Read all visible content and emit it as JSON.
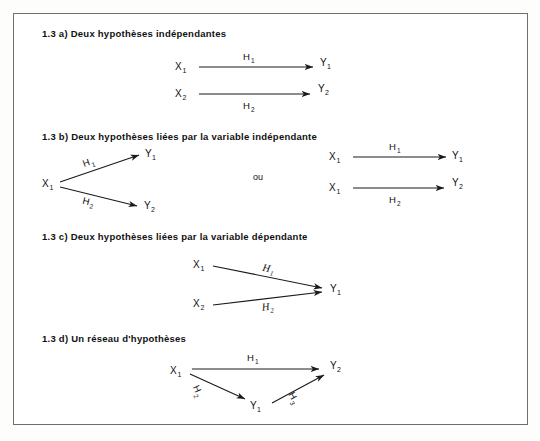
{
  "figure": {
    "frame_color": "#6f6f6f",
    "ink_color": "#111111",
    "separator_label": "ou"
  },
  "sections": [
    {
      "id": "a",
      "heading": "1.3 a)  Deux hypothèses indépendantes",
      "diagram_type": "two-independent-arrows",
      "nodes": [
        {
          "label": "X",
          "sub": "1",
          "role": "independent"
        },
        {
          "label": "Y",
          "sub": "1",
          "role": "dependent"
        },
        {
          "label": "X",
          "sub": "2",
          "role": "independent"
        },
        {
          "label": "Y",
          "sub": "2",
          "role": "dependent"
        }
      ],
      "edges": [
        {
          "label": "H",
          "sub": "1",
          "from": "X1",
          "to": "Y1",
          "label_position": "above"
        },
        {
          "label": "H",
          "sub": "2",
          "from": "X2",
          "to": "Y2",
          "label_position": "below"
        }
      ]
    },
    {
      "id": "b",
      "heading": "1.3 b)  Deux hypothèses liées par la variable indépendante",
      "diagram_type": "diverging-then-equivalent-pair",
      "nodes": [
        {
          "label": "X",
          "sub": "1",
          "role": "independent"
        },
        {
          "label": "Y",
          "sub": "1",
          "role": "dependent"
        },
        {
          "label": "Y",
          "sub": "2",
          "role": "dependent"
        }
      ],
      "edges": [
        {
          "label": "H",
          "sub": "1",
          "from": "X1",
          "to": "Y1",
          "label_position": "along"
        },
        {
          "label": "H",
          "sub": "2",
          "from": "X1",
          "to": "Y2",
          "label_position": "along"
        }
      ],
      "alternative_nodes": [
        {
          "label": "X",
          "sub": "1",
          "role": "independent"
        },
        {
          "label": "Y",
          "sub": "1",
          "role": "dependent"
        },
        {
          "label": "X",
          "sub": "1",
          "role": "independent"
        },
        {
          "label": "Y",
          "sub": "2",
          "role": "dependent"
        }
      ],
      "alternative_edges": [
        {
          "label": "H",
          "sub": "1",
          "from": "X1",
          "to": "Y1",
          "label_position": "above"
        },
        {
          "label": "H",
          "sub": "2",
          "from": "X1",
          "to": "Y2",
          "label_position": "below"
        }
      ]
    },
    {
      "id": "c",
      "heading": "1.3 c)  Deux hypothèses liées par la variable dépendante",
      "diagram_type": "converging-arrows",
      "nodes": [
        {
          "label": "X",
          "sub": "1",
          "role": "independent"
        },
        {
          "label": "X",
          "sub": "2",
          "role": "independent"
        },
        {
          "label": "Y",
          "sub": "1",
          "role": "dependent"
        }
      ],
      "edges": [
        {
          "label": "H",
          "sub": "1",
          "from": "X1",
          "to": "Y1",
          "label_position": "along",
          "italic": true
        },
        {
          "label": "H",
          "sub": "2",
          "from": "X2",
          "to": "Y1",
          "label_position": "along",
          "italic": true
        }
      ]
    },
    {
      "id": "d",
      "heading": "1.3 d)  Un réseau d'hypothèses",
      "diagram_type": "triangle-network",
      "nodes": [
        {
          "label": "X",
          "sub": "1",
          "role": "independent"
        },
        {
          "label": "Y",
          "sub": "1",
          "role": "intermediate"
        },
        {
          "label": "Y",
          "sub": "2",
          "role": "dependent"
        }
      ],
      "edges": [
        {
          "label": "H",
          "sub": "1",
          "from": "X1",
          "to": "Y2",
          "label_position": "above"
        },
        {
          "label": "H",
          "sub": "2",
          "from": "X1",
          "to": "Y1",
          "label_position": "along"
        },
        {
          "label": "H",
          "sub": "3",
          "from": "Y1",
          "to": "Y2",
          "label_position": "along"
        }
      ]
    }
  ]
}
